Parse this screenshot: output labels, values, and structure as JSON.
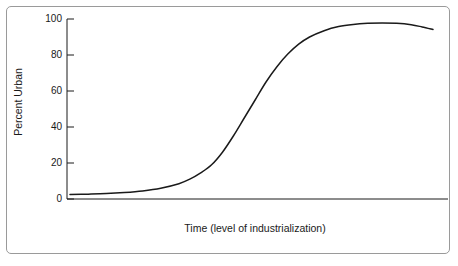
{
  "figure": {
    "background_color": "#ffffff",
    "frame_color": "#9a9a9a",
    "line_color": "#1a1a1a"
  },
  "chart_data": {
    "type": "line",
    "title": "",
    "subtitle": "",
    "xlabel": "Time (level of industrialization)",
    "ylabel": "Percent Urban",
    "xlim": [
      0,
      100
    ],
    "ylim": [
      0,
      100
    ],
    "grid": false,
    "legend": null,
    "legend_position": "none",
    "x_tick_labels": [],
    "y_tick_labels": [
      "0",
      "20",
      "40",
      "60",
      "80",
      "100"
    ],
    "y_ticks": [
      0,
      20,
      40,
      60,
      80,
      100
    ],
    "annotations": [],
    "series": [
      {
        "name": "Percent Urban",
        "color": "#1a1a1a",
        "x": [
          0,
          5,
          10,
          15,
          20,
          25,
          30,
          33,
          36,
          39,
          42,
          45,
          48,
          51,
          54,
          57,
          60,
          63,
          66,
          70,
          74,
          78,
          82,
          86,
          90,
          94,
          97,
          100
        ],
        "y": [
          2.5,
          2.7,
          3.0,
          3.6,
          4.5,
          6.0,
          8.5,
          11.0,
          14.5,
          19.0,
          26.0,
          35.0,
          45.0,
          55.0,
          65.0,
          73.5,
          80.5,
          86.0,
          90.0,
          93.5,
          95.8,
          97.0,
          97.6,
          97.8,
          97.6,
          96.8,
          95.6,
          94.2
        ]
      }
    ]
  },
  "axis_labels": {
    "y": {
      "t100": "100",
      "t80": "80",
      "t60": "60",
      "t40": "40",
      "t20": "20",
      "t0": "0"
    }
  }
}
